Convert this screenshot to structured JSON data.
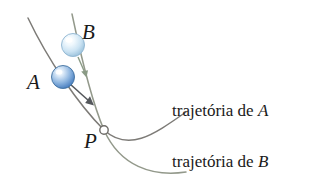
{
  "figure": {
    "width": 323,
    "height": 187,
    "background": "#ffffff"
  },
  "labels": {
    "sphere_a": "A",
    "sphere_b": "B",
    "point_p": "P",
    "trajectory_a_prefix": "trajetória de ",
    "trajectory_a_var": "A",
    "trajectory_b_prefix": "trajetória de ",
    "trajectory_b_var": "B"
  },
  "colors": {
    "curve_a": "#7d7b77",
    "curve_b": "#9aa08f",
    "sphere_a_fill": "#6f9fd8",
    "sphere_a_light": "#e8f1fb",
    "sphere_a_stroke": "#3f6fae",
    "sphere_b_fill": "#bcd9ee",
    "sphere_b_light": "#f4fafe",
    "sphere_b_stroke": "#7fa9c9",
    "point_p_stroke": "#6e6c68",
    "point_p_fill": "#ffffff",
    "text": "#1a1a1a",
    "arrow_a": "#55585c",
    "arrow_b": "#8a9a85"
  },
  "geometry": {
    "point_p": {
      "x": 104,
      "y": 130,
      "radius": 4
    },
    "sphere_a": {
      "cx": 63,
      "cy": 77,
      "r": 11
    },
    "sphere_b": {
      "cx": 73,
      "cy": 45,
      "r": 11
    },
    "curve_a_path": "M 28 18 C 48 60, 78 104, 104 130 C 128 152, 152 136, 186 112",
    "curve_b_path": "M 72 14 C 80 52, 92 102, 104 130 C 120 166, 150 176, 186 172",
    "arrow_a": {
      "tip_x": 93,
      "tip_y": 99
    },
    "arrow_b": {
      "tip_x": 84,
      "tip_y": 75
    }
  }
}
